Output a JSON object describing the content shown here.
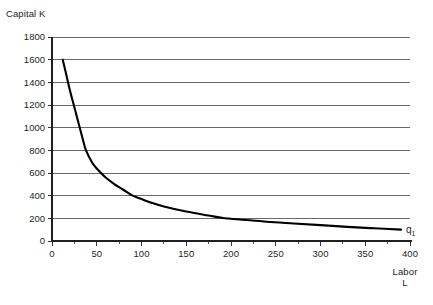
{
  "chart_data": {
    "type": "line",
    "title": "",
    "subtitle": "",
    "xlabel": "Labor",
    "xlabel_line2": "L",
    "ylabel": "Capital K",
    "xlim": [
      0,
      400
    ],
    "ylim": [
      0,
      1800
    ],
    "x_ticks": [
      0,
      50,
      100,
      150,
      200,
      250,
      300,
      350,
      400
    ],
    "x_tick_labels": [
      "0",
      "50",
      "100",
      "150",
      "200",
      "250",
      "300",
      "350",
      "400"
    ],
    "x_minor_tick_step": 25,
    "y_ticks": [
      0,
      200,
      400,
      600,
      800,
      1000,
      1200,
      1400,
      1600,
      1800
    ],
    "y_tick_labels": [
      "0",
      "200",
      "400",
      "600",
      "800",
      "1000",
      "1200",
      "1400",
      "1600",
      "1800"
    ],
    "grid": "horizontal",
    "legend": "none",
    "series": [
      {
        "name": "q1",
        "annotation": "q",
        "annotation_subscript": "1",
        "color": "#000000",
        "description": "Isoquant curve, constant output q1, approximately K = 38500 / L",
        "x": [
          12,
          15,
          20,
          25,
          30,
          35,
          38,
          45,
          50,
          60,
          70,
          80,
          90,
          100,
          110,
          125,
          150,
          175,
          193,
          210,
          240,
          270,
          300,
          330,
          360,
          390
        ],
        "y": [
          1600,
          1500,
          1330,
          1180,
          1030,
          880,
          800,
          690,
          640,
          560,
          500,
          450,
          400,
          370,
          340,
          305,
          260,
          225,
          200,
          190,
          170,
          155,
          140,
          125,
          112,
          100
        ]
      }
    ]
  },
  "labels": {
    "y_axis_title": "Capital K",
    "x_axis_title": "Labor",
    "x_axis_title_line2": "L",
    "curve_label": "q",
    "curve_label_subscript": "1"
  },
  "colors": {
    "curve": "#000000",
    "gridline": "#58595b",
    "axis": "#231f20",
    "text": "#231f20",
    "background": "#ffffff"
  }
}
